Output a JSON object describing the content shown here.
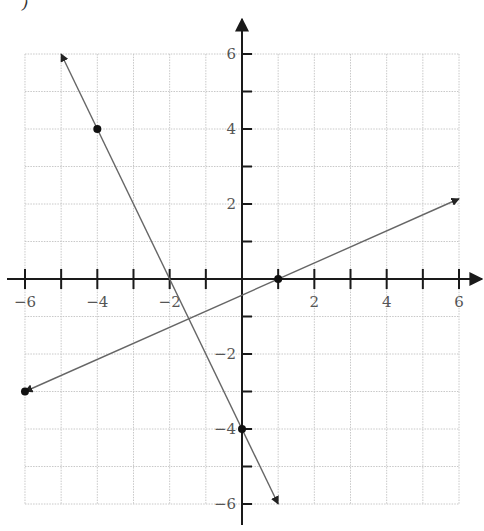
{
  "corner_text": ")",
  "chart_data": {
    "type": "line",
    "title": "",
    "xlabel": "",
    "ylabel": "",
    "xlim": [
      -6,
      6
    ],
    "ylim": [
      -6,
      6
    ],
    "grid": true,
    "grid_step": 1,
    "x_ticks": [
      -6,
      -5,
      -4,
      -3,
      -2,
      -1,
      0,
      1,
      2,
      3,
      4,
      5,
      6
    ],
    "y_ticks": [
      -6,
      -5,
      -4,
      -3,
      -2,
      -1,
      0,
      1,
      2,
      3,
      4,
      5,
      6
    ],
    "x_tick_labels": [
      "-6",
      "-4",
      "-2",
      "2",
      "4",
      "6"
    ],
    "y_tick_labels": [
      "6",
      "4",
      "2",
      "-2",
      "-4",
      "-6"
    ],
    "series": [
      {
        "name": "line-1",
        "equation": "y = -2x - 4",
        "x": [
          -5,
          1
        ],
        "y": [
          6,
          -6
        ],
        "arrows": "both"
      },
      {
        "name": "line-2",
        "equation": "y = (3/7)(x - 1)",
        "x": [
          -6,
          6
        ],
        "y": [
          -3,
          2.14
        ],
        "arrows": "both"
      }
    ],
    "points": [
      {
        "x": -4,
        "y": 4
      },
      {
        "x": 0,
        "y": -4
      },
      {
        "x": 1,
        "y": 0
      },
      {
        "x": -6,
        "y": -3
      }
    ],
    "colors": {
      "axis": "#1a1a1a",
      "grid": "#c8c8c8",
      "line": "#666666",
      "point": "#111111",
      "label": "#555555"
    }
  }
}
